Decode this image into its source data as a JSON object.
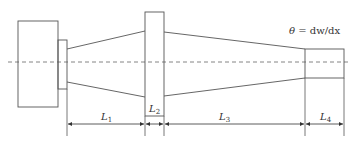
{
  "diagram": {
    "type": "stepped-tapered-shaft-schematic",
    "colors": {
      "stroke": "#555555",
      "centerline": "#666666",
      "text": "#333333",
      "background": "#ffffff"
    },
    "annotation": {
      "symbol": "θ",
      "equation": " = dw/dx"
    },
    "segments": [
      {
        "id": "L1",
        "label": "L",
        "sub": "1",
        "shape": "taper"
      },
      {
        "id": "L2",
        "label": "L",
        "sub": "2",
        "shape": "flange"
      },
      {
        "id": "L3",
        "label": "L",
        "sub": "3",
        "shape": "taper"
      },
      {
        "id": "L4",
        "label": "L",
        "sub": "4",
        "shape": "cylinder"
      }
    ]
  }
}
